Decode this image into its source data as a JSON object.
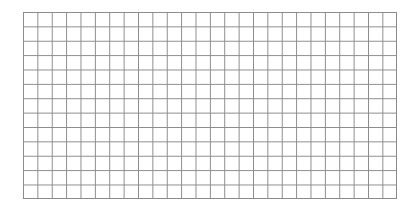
{
  "grid": {
    "columns": 26,
    "rows": 13,
    "line_color": "#8a8a8a",
    "background_color": "#ffffff"
  }
}
